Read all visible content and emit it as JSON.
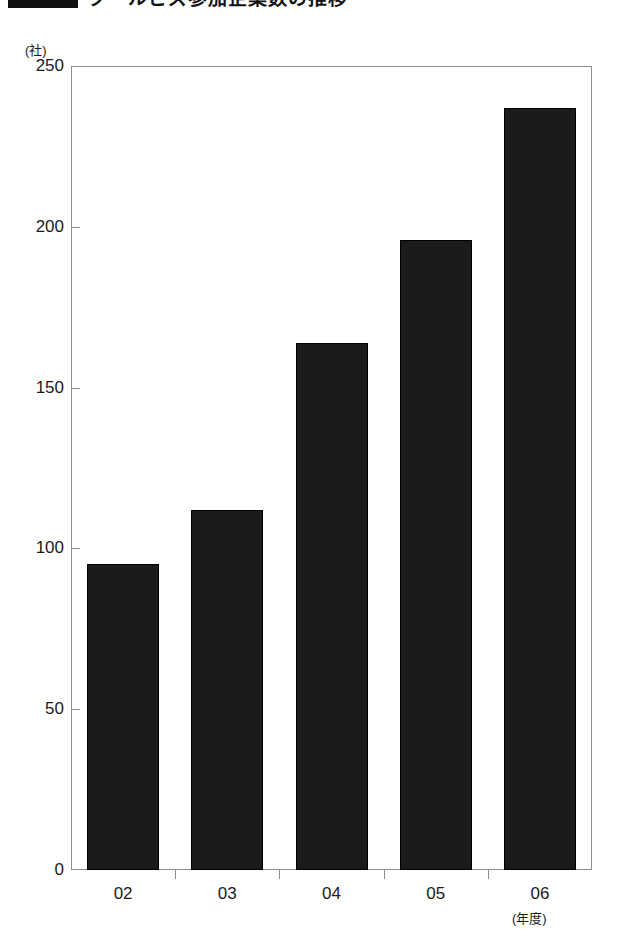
{
  "title": {
    "swatch_color": "#111111",
    "text": "クールビズ参加企業数の推移"
  },
  "chart_data": {
    "type": "bar",
    "title": "クールビズ参加企業数の推移",
    "categories": [
      "02",
      "03",
      "04",
      "05",
      "06"
    ],
    "values": [
      95,
      112,
      164,
      196,
      237
    ],
    "xlabel": "(年度)",
    "ylabel": "(社)",
    "ylim": [
      0,
      250
    ],
    "yticks": [
      0,
      50,
      100,
      150,
      200,
      250
    ],
    "ytick_labels": [
      "0",
      "50",
      "100",
      "150",
      "200",
      "250"
    ],
    "grid": false,
    "legend": null,
    "bar_color": "#1b1b1b",
    "axis_color": "#8d8d8d"
  }
}
